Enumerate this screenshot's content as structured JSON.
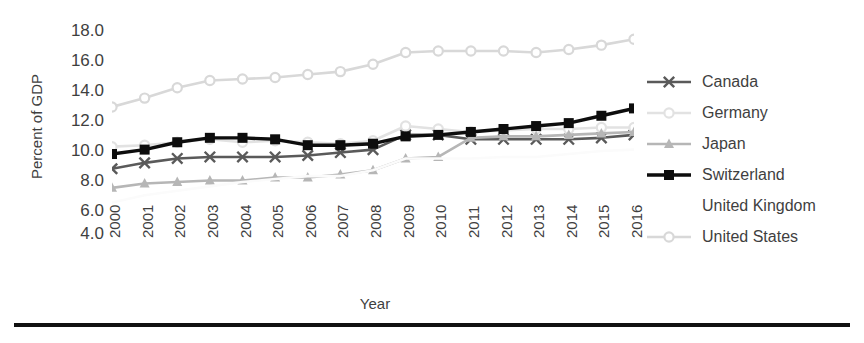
{
  "axis": {
    "ylabel": "Percent of GDP",
    "xlabel": "Year",
    "yticks": [
      "18.0",
      "16.0",
      "14.0",
      "12.0",
      "10.0",
      "8.0",
      "6.0",
      "4.0"
    ],
    "xticks": [
      "2000",
      "2001",
      "2002",
      "2003",
      "2004",
      "2005",
      "2006",
      "2007",
      "2008",
      "2009",
      "2010",
      "2011",
      "2012",
      "2013",
      "2014",
      "2015",
      "2016"
    ]
  },
  "legend": {
    "items": [
      {
        "label": "Canada",
        "color": "#5a5a5a",
        "marker": "x-marker-icon"
      },
      {
        "label": "Germany",
        "color": "#e2e2e2",
        "marker": "circle-marker-icon"
      },
      {
        "label": "Japan",
        "color": "#b6b6b6",
        "marker": "triangle-marker-icon"
      },
      {
        "label": "Switzerland",
        "color": "#0d0d0d",
        "marker": "square-marker-icon"
      },
      {
        "label": "United Kingdom",
        "color": "#fbfbfb",
        "marker": "blank-marker-icon"
      },
      {
        "label": "United States",
        "color": "#d8d8d8",
        "marker": "circle-marker-icon"
      }
    ]
  },
  "chart_data": {
    "type": "line",
    "title": "",
    "xlabel": "Year",
    "ylabel": "Percent of GDP",
    "ylim": [
      4.0,
      18.0
    ],
    "ytick_step": 2.0,
    "grid": false,
    "legend_position": "right",
    "x": [
      2000,
      2001,
      2002,
      2003,
      2004,
      2005,
      2006,
      2007,
      2008,
      2009,
      2010,
      2011,
      2012,
      2013,
      2014,
      2015,
      2016
    ],
    "series": [
      {
        "name": "Canada",
        "color": "#5a5a5a",
        "marker": "x",
        "values": [
          8.3,
          8.7,
          9.0,
          9.1,
          9.1,
          9.1,
          9.2,
          9.4,
          9.6,
          10.6,
          10.6,
          10.3,
          10.3,
          10.3,
          10.3,
          10.4,
          10.6
        ]
      },
      {
        "name": "Germany",
        "color": "#e2e2e2",
        "marker": "circle",
        "values": [
          9.8,
          9.9,
          10.1,
          10.3,
          10.1,
          10.2,
          10.1,
          10.0,
          10.2,
          11.2,
          11.0,
          10.8,
          10.9,
          11.0,
          11.0,
          11.1,
          11.1
        ]
      },
      {
        "name": "Japan",
        "color": "#b6b6b6",
        "marker": "triangle",
        "values": [
          7.0,
          7.3,
          7.4,
          7.5,
          7.5,
          7.7,
          7.7,
          7.9,
          8.2,
          9.0,
          9.1,
          10.4,
          10.5,
          10.5,
          10.6,
          10.7,
          10.8
        ]
      },
      {
        "name": "Switzerland",
        "color": "#0d0d0d",
        "marker": "square",
        "values": [
          9.3,
          9.6,
          10.1,
          10.4,
          10.4,
          10.3,
          9.9,
          9.9,
          10.0,
          10.5,
          10.6,
          10.8,
          11.0,
          11.2,
          11.4,
          11.9,
          12.4
        ]
      },
      {
        "name": "United Kingdom",
        "color": "#fbfbfb",
        "marker": "none",
        "values": [
          6.0,
          6.5,
          6.8,
          7.1,
          7.4,
          7.6,
          7.8,
          7.8,
          8.2,
          9.0,
          9.0,
          9.0,
          9.1,
          9.1,
          9.3,
          9.5,
          9.6
        ]
      },
      {
        "name": "United States",
        "color": "#d8d8d8",
        "marker": "circle",
        "values": [
          12.5,
          13.1,
          13.8,
          14.3,
          14.4,
          14.5,
          14.7,
          14.9,
          15.4,
          16.2,
          16.3,
          16.3,
          16.3,
          16.2,
          16.4,
          16.7,
          17.1
        ]
      }
    ]
  }
}
